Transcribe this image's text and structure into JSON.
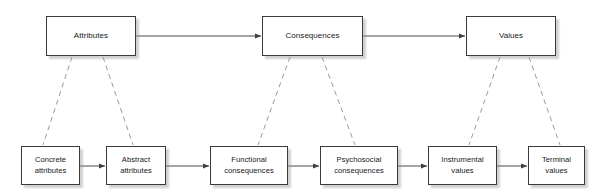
{
  "diagram": {
    "background_color": "#ffffff",
    "box_border_color": "#3a3a3a",
    "box_fill_color": "#ffffff",
    "text_color": "#17171a",
    "solid_link_color": "#4a4a4a",
    "dashed_link_color": "#9a9a9a",
    "top_level": {
      "nodes": [
        {
          "id": "attributes",
          "label": "Attributes",
          "x": 46,
          "y": 16,
          "w": 90,
          "h": 40
        },
        {
          "id": "consequences",
          "label": "Consequences",
          "x": 262,
          "y": 16,
          "w": 101,
          "h": 40
        },
        {
          "id": "values",
          "label": "Values",
          "x": 466,
          "y": 16,
          "w": 90,
          "h": 40
        }
      ]
    },
    "bottom_level": {
      "nodes": [
        {
          "id": "concrete-attributes",
          "label": "Concrete\nattributes",
          "x": 21,
          "y": 146,
          "w": 59,
          "h": 39
        },
        {
          "id": "abstract-attributes",
          "label": "Abstract\nattributes",
          "x": 106,
          "y": 146,
          "w": 60,
          "h": 39
        },
        {
          "id": "functional-consequences",
          "label": "Functional\nconsequences",
          "x": 210,
          "y": 146,
          "w": 78,
          "h": 39
        },
        {
          "id": "psychosocial-consequences",
          "label": "Psychosocial\nconsequences",
          "x": 320,
          "y": 146,
          "w": 78,
          "h": 39
        },
        {
          "id": "instrumental-values",
          "label": "Instrumental\nvalues",
          "x": 428,
          "y": 146,
          "w": 69,
          "h": 39
        },
        {
          "id": "terminal-values",
          "label": "Terminal\nvalues",
          "x": 528,
          "y": 146,
          "w": 57,
          "h": 39
        }
      ]
    },
    "solid_arrows": [
      {
        "id": "attributes-to-consequences",
        "from": "attributes",
        "to": "consequences",
        "x1": 136,
        "y1": 36,
        "x2": 261,
        "y2": 36
      },
      {
        "id": "consequences-to-values",
        "from": "consequences",
        "to": "values",
        "x1": 363,
        "y1": 36,
        "x2": 465,
        "y2": 36
      },
      {
        "id": "concrete-to-abstract",
        "from": "concrete-attributes",
        "to": "abstract-attributes",
        "x1": 80,
        "y1": 166,
        "x2": 105,
        "y2": 166
      },
      {
        "id": "abstract-to-functional",
        "from": "abstract-attributes",
        "to": "functional-consequences",
        "x1": 166,
        "y1": 166,
        "x2": 209,
        "y2": 166
      },
      {
        "id": "functional-to-psychosocial",
        "from": "functional-consequences",
        "to": "psychosocial-consequences",
        "x1": 288,
        "y1": 166,
        "x2": 319,
        "y2": 166
      },
      {
        "id": "psychosocial-to-instrumental",
        "from": "psychosocial-consequences",
        "to": "instrumental-values",
        "x1": 398,
        "y1": 166,
        "x2": 427,
        "y2": 166
      },
      {
        "id": "instrumental-to-terminal",
        "from": "instrumental-values",
        "to": "terminal-values",
        "x1": 497,
        "y1": 166,
        "x2": 527,
        "y2": 166
      }
    ],
    "dashed_links": [
      {
        "id": "attributes-to-concrete",
        "from": "attributes",
        "to": "concrete-attributes",
        "x1": 72,
        "y1": 57,
        "x2": 43,
        "y2": 145
      },
      {
        "id": "attributes-to-abstract",
        "from": "attributes",
        "to": "abstract-attributes",
        "x1": 103,
        "y1": 57,
        "x2": 133,
        "y2": 145
      },
      {
        "id": "consequences-to-functional",
        "from": "consequences",
        "to": "functional-consequences",
        "x1": 290,
        "y1": 57,
        "x2": 258,
        "y2": 145
      },
      {
        "id": "consequences-to-psychosocial",
        "from": "consequences",
        "to": "psychosocial-consequences",
        "x1": 322,
        "y1": 57,
        "x2": 355,
        "y2": 145
      },
      {
        "id": "values-to-instrumental",
        "from": "values",
        "to": "instrumental-values",
        "x1": 500,
        "y1": 57,
        "x2": 469,
        "y2": 145
      },
      {
        "id": "values-to-terminal",
        "from": "values",
        "to": "terminal-values",
        "x1": 529,
        "y1": 57,
        "x2": 560,
        "y2": 145
      }
    ]
  }
}
